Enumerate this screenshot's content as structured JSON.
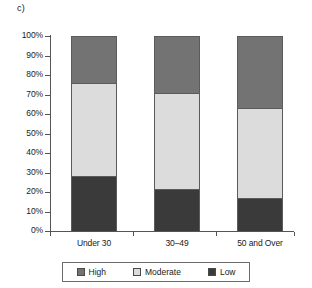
{
  "panel": {
    "label": "c)"
  },
  "chart_data": {
    "type": "bar",
    "subtype": "stacked-100-percent",
    "title": "",
    "subtitle": "",
    "xlabel": "",
    "ylabel": "",
    "categories": [
      "Under 30",
      "30–49",
      "50 and Over"
    ],
    "series": [
      {
        "name": "Low",
        "values": [
          28,
          21.5,
          17
        ],
        "color": "#3a3a3a"
      },
      {
        "name": "Moderate",
        "values": [
          48,
          49.5,
          46
        ],
        "color": "#dcdcdc"
      },
      {
        "name": "High",
        "values": [
          24,
          29,
          37
        ],
        "color": "#737373"
      }
    ],
    "stack_order_bottom_to_top": [
      "Low",
      "Moderate",
      "High"
    ],
    "cumulative_boundaries_percent": {
      "Under 30": {
        "low_top": 28,
        "moderate_top": 76,
        "high_top": 100
      },
      "30–49": {
        "low_top": 21.5,
        "moderate_top": 71,
        "high_top": 100
      },
      "50 and Over": {
        "low_top": 17,
        "moderate_top": 63,
        "high_top": 100
      }
    },
    "ylim": [
      0,
      100
    ],
    "ytick_labels": [
      "100%",
      "90%",
      "80%",
      "70%",
      "60%",
      "50%",
      "40%",
      "30%",
      "20%",
      "10%",
      "0%"
    ],
    "ytick_values": [
      100,
      90,
      80,
      70,
      60,
      50,
      40,
      30,
      20,
      10,
      0
    ],
    "grid": false,
    "legend": {
      "position": "bottom",
      "entries": [
        {
          "label": "High",
          "color": "#737373"
        },
        {
          "label": "Moderate",
          "color": "#dcdcdc"
        },
        {
          "label": "Low",
          "color": "#3a3a3a"
        }
      ]
    }
  },
  "colors": {
    "high": "#737373",
    "moderate": "#dcdcdc",
    "low": "#3a3a3a",
    "axis": "#555555",
    "outline": "#5b5b5b",
    "background": "#ffffff"
  }
}
